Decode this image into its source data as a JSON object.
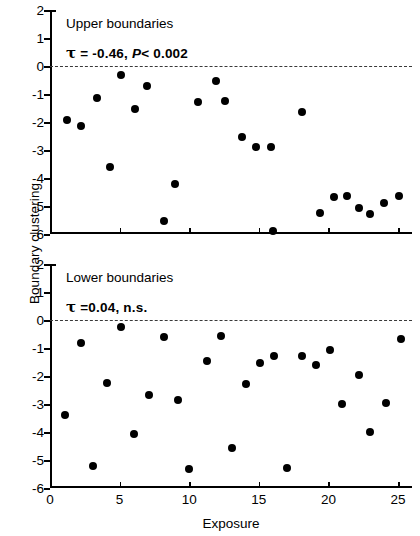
{
  "figure": {
    "ylabel": "Boundary clustering",
    "xlabel": "Exposure"
  },
  "axis": {
    "yticks": [
      "2",
      "1",
      "0",
      "-1",
      "-2",
      "-3",
      "-4",
      "-5",
      "-6"
    ],
    "xticks": [
      "0",
      "5",
      "10",
      "15",
      "20",
      "25"
    ]
  },
  "panels": {
    "upper": {
      "title": "Upper boundaries",
      "tau_symbol": "τ",
      "stat_prefix": " =  ",
      "tau_value": "-0.46,",
      "p_symbol": "P",
      "p_value": "< 0.002"
    },
    "lower": {
      "title": "Lower boundaries",
      "tau_symbol": "τ",
      "stat_prefix": " =",
      "tau_value": "0.04,",
      "p_symbol": "",
      "p_value": "n.s."
    }
  },
  "chart_data": [
    {
      "type": "scatter",
      "title": "Upper boundaries",
      "xlabel": "Exposure",
      "ylabel": "Boundary clustering",
      "xlim": [
        0,
        26
      ],
      "ylim": [
        -6,
        2
      ],
      "grid": false,
      "legend": null,
      "marker": "filled-circle",
      "marker_color": "#000000",
      "reference_line": {
        "y": 0,
        "style": "dashed",
        "color": "#3a3a3a"
      },
      "annotations": [
        "τ =  -0.46, P< 0.002"
      ],
      "stats": {
        "tau": -0.46,
        "p": "< 0.002"
      },
      "points": [
        {
          "x": 1.2,
          "y": -1.93
        },
        {
          "x": 2.2,
          "y": -2.15
        },
        {
          "x": 3.4,
          "y": -1.15
        },
        {
          "x": 4.3,
          "y": -3.59
        },
        {
          "x": 5.1,
          "y": -0.31
        },
        {
          "x": 6.1,
          "y": -1.52
        },
        {
          "x": 7.0,
          "y": -0.7
        },
        {
          "x": 8.2,
          "y": -5.53
        },
        {
          "x": 9.0,
          "y": -4.22
        },
        {
          "x": 10.6,
          "y": -1.29
        },
        {
          "x": 11.9,
          "y": -0.54
        },
        {
          "x": 12.6,
          "y": -1.24
        },
        {
          "x": 13.8,
          "y": -2.54
        },
        {
          "x": 14.8,
          "y": -2.9
        },
        {
          "x": 15.9,
          "y": -2.9
        },
        {
          "x": 16.0,
          "y": -5.9
        },
        {
          "x": 18.1,
          "y": -1.64
        },
        {
          "x": 19.4,
          "y": -5.26
        },
        {
          "x": 20.4,
          "y": -4.67
        },
        {
          "x": 21.3,
          "y": -4.65
        },
        {
          "x": 22.2,
          "y": -5.06
        },
        {
          "x": 23.0,
          "y": -5.28
        },
        {
          "x": 24.0,
          "y": -4.9
        },
        {
          "x": 25.1,
          "y": -4.63
        }
      ]
    },
    {
      "type": "scatter",
      "title": "Lower boundaries",
      "xlabel": "Exposure",
      "ylabel": "Boundary clustering",
      "xlim": [
        0,
        26
      ],
      "ylim": [
        -6,
        2
      ],
      "grid": false,
      "legend": null,
      "marker": "filled-circle",
      "marker_color": "#000000",
      "reference_line": {
        "y": 0,
        "style": "dashed",
        "color": "#3a3a3a"
      },
      "annotations": [
        "τ =0.04, n.s."
      ],
      "stats": {
        "tau": 0.04,
        "p": "n.s."
      },
      "points": [
        {
          "x": 1.1,
          "y": -3.4
        },
        {
          "x": 2.2,
          "y": -0.83
        },
        {
          "x": 3.1,
          "y": -5.2
        },
        {
          "x": 4.1,
          "y": -2.25
        },
        {
          "x": 5.1,
          "y": -0.26
        },
        {
          "x": 6.0,
          "y": -4.08
        },
        {
          "x": 7.1,
          "y": -2.67
        },
        {
          "x": 8.2,
          "y": -0.62
        },
        {
          "x": 9.2,
          "y": -2.84
        },
        {
          "x": 10.0,
          "y": -5.32
        },
        {
          "x": 11.3,
          "y": -1.48
        },
        {
          "x": 12.3,
          "y": -0.56
        },
        {
          "x": 13.1,
          "y": -4.57
        },
        {
          "x": 14.1,
          "y": -2.27
        },
        {
          "x": 15.1,
          "y": -1.55
        },
        {
          "x": 16.1,
          "y": -1.3
        },
        {
          "x": 17.0,
          "y": -5.3
        },
        {
          "x": 18.1,
          "y": -1.29
        },
        {
          "x": 19.1,
          "y": -1.6
        },
        {
          "x": 20.1,
          "y": -1.08
        },
        {
          "x": 21.0,
          "y": -3.0
        },
        {
          "x": 22.2,
          "y": -1.95
        },
        {
          "x": 23.0,
          "y": -4.0
        },
        {
          "x": 24.1,
          "y": -2.95
        },
        {
          "x": 25.2,
          "y": -0.68
        }
      ]
    }
  ]
}
